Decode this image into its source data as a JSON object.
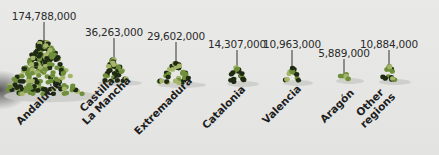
{
  "chart_data": {
    "type": "bar",
    "title": "",
    "xlabel": "",
    "ylabel": "",
    "categories": [
      "Andalucía",
      "Castilla-La Mancha",
      "Extremadura",
      "Catalonia",
      "Valencia",
      "Aragón",
      "Other regions"
    ],
    "values": [
      174788000,
      36263000,
      29602000,
      14307000,
      10963000,
      5889000,
      10884000
    ],
    "value_labels": [
      "174,788,000",
      "36,263,000",
      "29,602,000",
      "14,307,000",
      "10,963,000",
      "5,889,000",
      "10,884,000"
    ],
    "style": "pictogram piles of olives",
    "grid": false,
    "legend": "none"
  },
  "items": [
    {
      "label": "Andalucía",
      "value": "174,788,000"
    },
    {
      "label": "Castilla-",
      "label2": "La Mancha",
      "value": "36,263,000"
    },
    {
      "label": "Extremadura",
      "value": "29,602,000"
    },
    {
      "label": "Catalonia",
      "value": "14,307,000"
    },
    {
      "label": "Valencia",
      "value": "10,963,000"
    },
    {
      "label": "Aragón",
      "value": "5,889,000"
    },
    {
      "label": "Other",
      "label2": "regions",
      "value": "10,884,000"
    }
  ],
  "colors": {
    "background": "#e6e7e5",
    "olive_dark": "#1f2a12",
    "olive_green": "#6f8f3a",
    "olive_light": "#a5b56a",
    "text": "#222222"
  }
}
